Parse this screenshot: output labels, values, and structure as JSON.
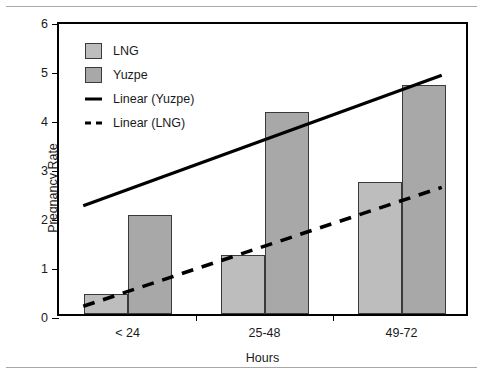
{
  "chart_data": {
    "type": "bar",
    "title": "",
    "xlabel": "Hours",
    "ylabel": "Pregnancy Rate",
    "categories": [
      "< 24",
      "25-48",
      "49-72"
    ],
    "ylim": [
      0,
      6
    ],
    "yticks": [
      0,
      1,
      2,
      3,
      4,
      5,
      6
    ],
    "ytick_labels": [
      "0",
      "1",
      "2",
      "3",
      "4",
      "5",
      "6"
    ],
    "grid": false,
    "legend_position": "upper-left",
    "series": [
      {
        "name": "LNG",
        "type": "bar",
        "color": "#bdbdbd",
        "values": [
          0.41,
          1.2,
          2.69
        ]
      },
      {
        "name": "Yuzpe",
        "type": "bar",
        "color": "#a8a8a8",
        "values": [
          2.02,
          4.12,
          4.67
        ]
      },
      {
        "name": "Linear (Yuzpe)",
        "type": "line",
        "style": "solid",
        "color": "#000000",
        "endpoints": [
          2.24,
          4.94
        ]
      },
      {
        "name": "Linear (LNG)",
        "type": "line",
        "style": "dashed",
        "color": "#000000",
        "endpoints": [
          0.16,
          2.62
        ]
      }
    ],
    "legend": [
      {
        "label": "LNG",
        "marker": "swatch-light"
      },
      {
        "label": "Yuzpe",
        "marker": "swatch-dark"
      },
      {
        "label": "Linear (Yuzpe)",
        "marker": "solid-line"
      },
      {
        "label": "Linear (LNG)",
        "marker": "dashed-line"
      }
    ]
  }
}
